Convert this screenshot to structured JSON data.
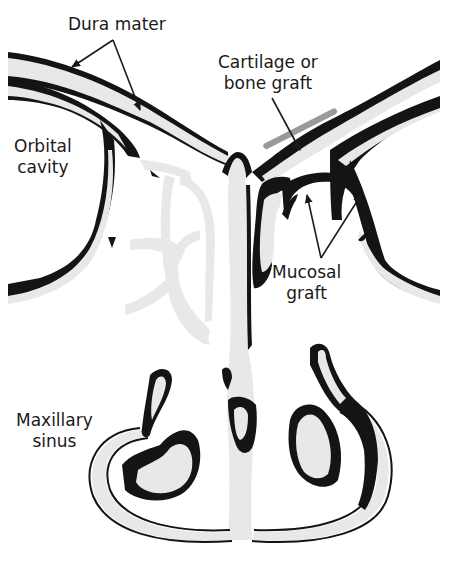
{
  "figure": {
    "type": "anatomical-cross-section"
  },
  "labels": {
    "dura_mater": {
      "text": "Dura mater"
    },
    "cartilage_graft": {
      "line1": "Cartilage or",
      "line2": "bone graft"
    },
    "orbital_cavity": {
      "line1": "Orbital",
      "line2": "cavity"
    },
    "mucosal_graft": {
      "line1": "Mucosal",
      "line2": "graft"
    },
    "maxillary_sinus": {
      "line1": "Maxillary",
      "line2": "sinus"
    }
  },
  "colors": {
    "bone": "#e8e8e8",
    "soft_tissue": "#141414",
    "graft": "#9a9a9a",
    "background": "#ffffff",
    "text": "#1a1a1a"
  }
}
